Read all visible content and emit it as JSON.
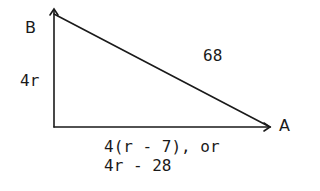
{
  "diagram": {
    "type": "right-triangle",
    "vertices": {
      "top": "B",
      "right": "A"
    },
    "labels": {
      "vertical_side": "4r",
      "hypotenuse": "68",
      "base_line1": "4(r - 7), or",
      "base_line2": "4r - 28"
    },
    "colors": {
      "stroke": "#1a1a1a",
      "background": "#ffffff"
    }
  }
}
